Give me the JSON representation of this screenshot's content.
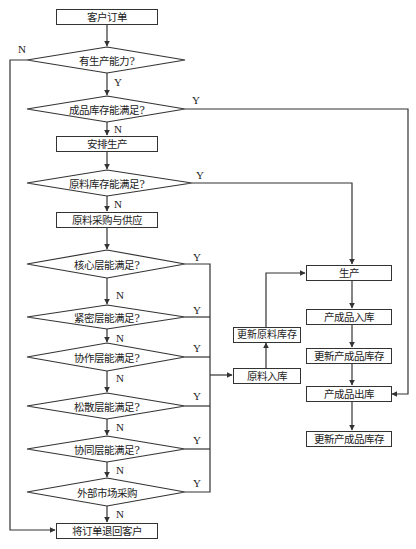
{
  "flowchart": {
    "nodes": {
      "order": "客户订单",
      "capacity": "有生产能力?",
      "finished_stock": "成品库存能满足?",
      "schedule": "安排生产",
      "material_stock": "原料库存能满足?",
      "procure": "原料采购与供应",
      "core": "核心层能满足?",
      "close": "紧密层能满足?",
      "cooperate": "协作层能满足?",
      "loose": "松散层能满足?",
      "collab": "协同层能满足?",
      "external": "外部市场采购",
      "reject": "将订单退回客户",
      "produce": "生产",
      "fp_in": "产成品入库",
      "update_fp_1": "更新产成品库存",
      "fp_out": "产成品出库",
      "update_fp_2": "更新产成品库存",
      "update_material": "更新原料库存",
      "material_in": "原料入库"
    },
    "labels": {
      "yes": "Y",
      "no": "N"
    },
    "colors": {
      "line": "#333333",
      "background": "#ffffff"
    }
  }
}
